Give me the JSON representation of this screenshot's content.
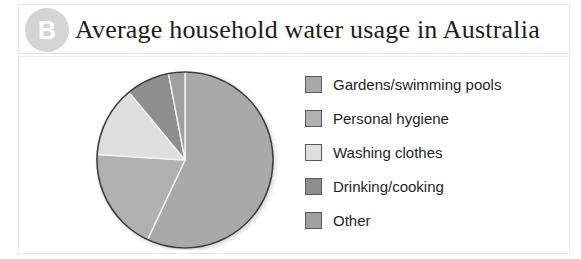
{
  "header": {
    "badge_label": "B",
    "badge_color": "#d4d4d4",
    "title": "Average household water usage in Australia"
  },
  "legend": {
    "items": [
      {
        "label": "Gardens/swimming pools",
        "color": "#a9a9a9"
      },
      {
        "label": "Personal hygiene",
        "color": "#b0b0b0"
      },
      {
        "label": "Washing clothes",
        "color": "#dedede"
      },
      {
        "label": "Drinking/cooking",
        "color": "#8e8e8e"
      },
      {
        "label": "Other",
        "color": "#a0a0a0"
      }
    ]
  },
  "chart_data": {
    "type": "pie",
    "title": "Average household water usage in Australia",
    "categories": [
      "Gardens/swimming pools",
      "Personal hygiene",
      "Washing clothes",
      "Drinking/cooking",
      "Other"
    ],
    "values": [
      57,
      19,
      13,
      8,
      3
    ],
    "unit": "%",
    "colors": [
      "#a9a9a9",
      "#b0b0b0",
      "#dedede",
      "#8e8e8e",
      "#a0a0a0"
    ],
    "start_angle_deg": 0,
    "direction": "clockwise",
    "legend_position": "right",
    "grid": false,
    "labels_shown": false
  }
}
